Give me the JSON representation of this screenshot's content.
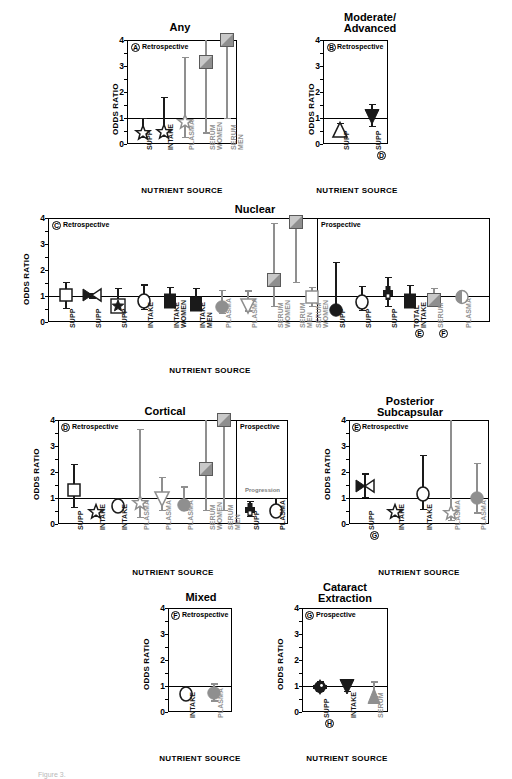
{
  "figure": {
    "axis_y_label": "ODDS RATIO",
    "axis_x_label": "NUTRIENT SOURCE",
    "y_ticks": [
      "0",
      "1",
      "2",
      "3",
      "4"
    ],
    "y_range": [
      0,
      4
    ],
    "reference_line": 1,
    "colors": {
      "black": "#1a1a1a",
      "gray": "#8f8f8f",
      "light_gray": "#b0b0b0",
      "frame": "#000000"
    }
  },
  "chart_data": {
    "type": "scatter",
    "ylabel": "ODDS RATIO",
    "xlabel": "NUTRIENT SOURCE",
    "ylim": [
      0,
      4
    ],
    "reference_line": 1,
    "grid": false,
    "panels": [
      {
        "id": "A",
        "title": "Any",
        "sections": [
          {
            "label": "Retrospective",
            "n": 5
          }
        ],
        "points": [
          {
            "category": "SUPP",
            "or": 0.42,
            "low": 0.4,
            "high": 1.0,
            "marker": "star",
            "color": "black"
          },
          {
            "category": "INTAKE",
            "or": 0.48,
            "low": 0.4,
            "high": 1.8,
            "marker": "star",
            "color": "black"
          },
          {
            "category": "PLASMA",
            "or": 0.85,
            "low": 0.27,
            "high": 3.35,
            "marker": "star",
            "color": "gray"
          },
          {
            "category": "SERUM\nWOMEN",
            "or": 3.15,
            "low": 0.45,
            "high": 4.0,
            "marker": "square",
            "color": "gray"
          },
          {
            "category": "SERUM\nMEN",
            "or": 4.0,
            "low": 1.0,
            "high": 4.0,
            "marker": "square",
            "color": "gray"
          }
        ]
      },
      {
        "id": "B",
        "title": "Moderate/\nAdvanced",
        "sections": [
          {
            "label": "Retrospective",
            "n": 2
          }
        ],
        "points": [
          {
            "category": "SUPP",
            "or": 0.55,
            "low": 0.35,
            "high": 0.8,
            "marker": "triangle-up-open",
            "color": "black"
          },
          {
            "category": "SUPP",
            "or": 1.05,
            "low": 0.7,
            "high": 1.55,
            "marker": "triangle-down-filled",
            "color": "black",
            "badge": "D"
          }
        ]
      },
      {
        "id": "C",
        "title": "Nuclear",
        "sections": [
          {
            "label": "Retrospective",
            "n": 11
          },
          {
            "label": "Prospective",
            "n": 6
          }
        ],
        "points": [
          {
            "category": "SUPP",
            "or": 1.05,
            "low": 0.55,
            "high": 1.55,
            "marker": "square-open",
            "color": "black"
          },
          {
            "category": "SUPP",
            "or": 1.02,
            "low": 0.95,
            "high": 1.1,
            "marker": "bowtie",
            "color": "black"
          },
          {
            "category": "SUPP",
            "or": 0.6,
            "low": 0.42,
            "high": 1.3,
            "marker": "square-open-star",
            "color": "black"
          },
          {
            "category": "INTAKE",
            "or": 0.8,
            "low": 0.5,
            "high": 1.45,
            "marker": "circle-open",
            "color": "black"
          },
          {
            "category": "INTAKE\nWOMEN",
            "or": 0.82,
            "low": 0.6,
            "high": 1.35,
            "marker": "square-filled",
            "color": "black"
          },
          {
            "category": "INTAKE\nMEN",
            "or": 0.7,
            "low": 0.52,
            "high": 1.3,
            "marker": "square-filled",
            "color": "black"
          },
          {
            "category": "PLASMA",
            "or": 0.58,
            "low": 0.34,
            "high": 1.25,
            "marker": "circle-filled",
            "color": "gray"
          },
          {
            "category": "PLASMA",
            "or": 0.62,
            "low": 0.45,
            "high": 1.22,
            "marker": "triangle-down-open",
            "color": "gray"
          },
          {
            "category": "SERUM\nWOMEN",
            "or": 1.6,
            "low": 0.62,
            "high": 3.8,
            "marker": "square",
            "color": "gray"
          },
          {
            "category": "SERUM\nMEN",
            "or": 3.85,
            "low": 1.55,
            "high": 4.0,
            "marker": "square",
            "color": "gray"
          },
          {
            "category": "SERUM\nWOMEN",
            "or": 0.95,
            "low": 0.62,
            "high": 1.35,
            "marker": "square-open",
            "color": "gray"
          },
          {
            "category": "SUPP",
            "or": 0.45,
            "low": 0.42,
            "high": 2.3,
            "marker": "circle-filled",
            "color": "black"
          },
          {
            "category": "SUPP",
            "or": 0.78,
            "low": 0.48,
            "high": 1.4,
            "marker": "circle-open",
            "color": "black"
          },
          {
            "category": "SUPP",
            "or": 1.1,
            "low": 0.62,
            "high": 1.75,
            "marker": "cross-filled",
            "color": "black"
          },
          {
            "category": "TOTAL\nINTAKE",
            "or": 0.82,
            "low": 0.62,
            "high": 1.42,
            "marker": "square-filled",
            "color": "black",
            "badge": "E"
          },
          {
            "category": "SERUM",
            "or": 0.86,
            "low": 0.62,
            "high": 1.3,
            "marker": "square",
            "color": "gray",
            "badge": "F"
          },
          {
            "category": "PLASMA",
            "or": 0.95,
            "low": 0.78,
            "high": 1.15,
            "marker": "circle-half",
            "color": "gray"
          }
        ]
      },
      {
        "id": "D",
        "title": "Cortical",
        "sections": [
          {
            "label": "Retrospective",
            "n": 8
          },
          {
            "label": "Prospective",
            "n": 2
          }
        ],
        "sublabel": "Progression",
        "points": [
          {
            "category": "SUPP",
            "or": 1.3,
            "low": 0.65,
            "high": 2.3,
            "marker": "square-open",
            "color": "black"
          },
          {
            "category": "INTAKE",
            "or": 0.45,
            "low": 0.45,
            "high": 0.45,
            "marker": "star",
            "color": "black"
          },
          {
            "category": "INTAKE",
            "or": 0.7,
            "low": 0.52,
            "high": 1.0,
            "marker": "circle-open",
            "color": "black"
          },
          {
            "category": "PLASMA",
            "or": 0.82,
            "low": 0.28,
            "high": 3.65,
            "marker": "star",
            "color": "gray"
          },
          {
            "category": "PLASMA",
            "or": 0.98,
            "low": 0.55,
            "high": 1.8,
            "marker": "triangle-down-open",
            "color": "gray"
          },
          {
            "category": "PLASMA",
            "or": 0.74,
            "low": 0.55,
            "high": 1.45,
            "marker": "circle-filled",
            "color": "gray"
          },
          {
            "category": "SERUM\nWOMEN",
            "or": 2.1,
            "low": 0.55,
            "high": 4.0,
            "marker": "square",
            "color": "gray"
          },
          {
            "category": "SERUM\nMEN",
            "or": 4.0,
            "low": 0.55,
            "high": 4.0,
            "marker": "square",
            "color": "gray"
          },
          {
            "category": "SUPP",
            "or": 0.55,
            "low": 0.3,
            "high": 0.9,
            "marker": "cross-filled",
            "color": "black"
          },
          {
            "category": "PLASMA",
            "or": 0.5,
            "low": 0.3,
            "high": 1.0,
            "marker": "circle-open",
            "color": "black"
          }
        ]
      },
      {
        "id": "E",
        "title": "Posterior\nSubcapsular",
        "sections": [
          {
            "label": "Retrospective",
            "n": 5
          }
        ],
        "points": [
          {
            "category": "SUPP",
            "or": 1.45,
            "low": 1.05,
            "high": 1.95,
            "marker": "bowtie",
            "color": "black",
            "badge": "G"
          },
          {
            "category": "INTAKE",
            "or": 0.45,
            "low": 0.45,
            "high": 0.45,
            "marker": "star",
            "color": "black"
          },
          {
            "category": "INTAKE",
            "or": 1.15,
            "low": 0.58,
            "high": 2.65,
            "marker": "circle-open",
            "color": "black"
          },
          {
            "category": "PLASMA",
            "or": 0.42,
            "low": 0.15,
            "high": 4.15,
            "marker": "star",
            "color": "gray"
          },
          {
            "category": "PLASMA",
            "or": 1.0,
            "low": 0.45,
            "high": 2.35,
            "marker": "circle-filled",
            "color": "gray"
          }
        ]
      },
      {
        "id": "F",
        "title": "Mixed",
        "sections": [
          {
            "label": "Retrospective",
            "n": 2
          }
        ],
        "points": [
          {
            "category": "INTAKE",
            "or": 0.7,
            "low": 0.5,
            "high": 1.0,
            "marker": "circle-open",
            "color": "black"
          },
          {
            "category": "PLASMA",
            "or": 0.72,
            "low": 0.45,
            "high": 1.1,
            "marker": "circle-filled",
            "color": "gray"
          }
        ]
      },
      {
        "id": "G",
        "title": "Cataract\nExtraction",
        "sections": [
          {
            "label": "Prospective",
            "n": 3
          }
        ],
        "points": [
          {
            "category": "SUPP",
            "or": 0.98,
            "low": 0.82,
            "high": 1.18,
            "marker": "cluster",
            "color": "black",
            "badge": "H"
          },
          {
            "category": "INTAKE",
            "or": 0.95,
            "low": 0.82,
            "high": 1.18,
            "marker": "triangle-down-filled",
            "color": "black"
          },
          {
            "category": "SERUM",
            "or": 0.62,
            "low": 0.62,
            "high": 1.18,
            "marker": "triangle-up-filled",
            "color": "gray"
          }
        ]
      }
    ]
  },
  "caption": "Figure 3."
}
